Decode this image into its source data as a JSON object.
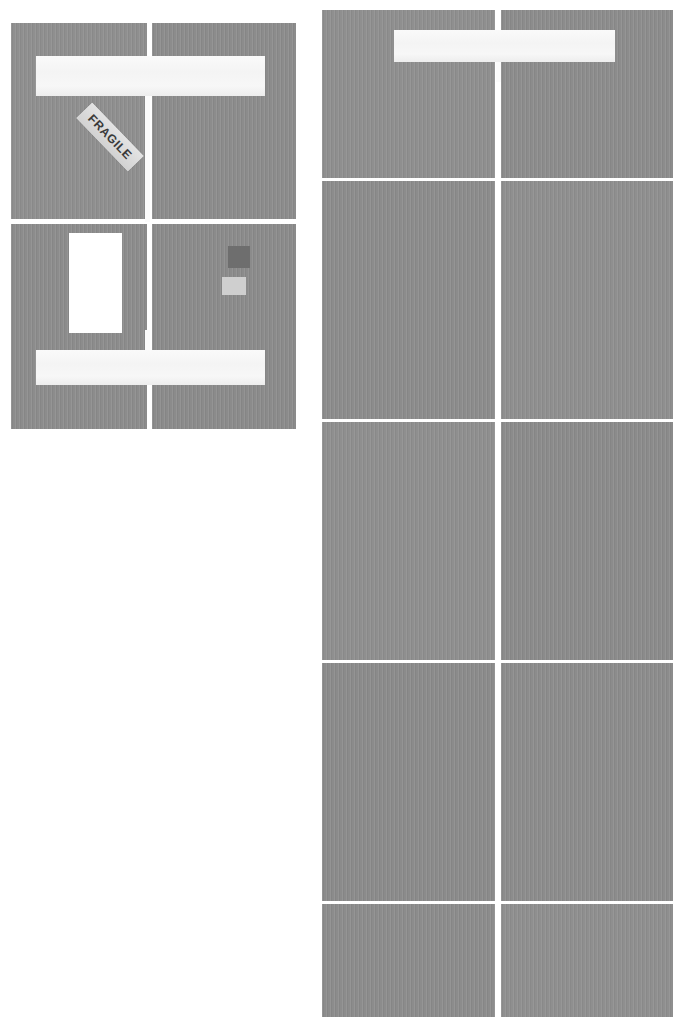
{
  "scene": {
    "title": "Flattened corrugated cardboard panels",
    "background_color": "#ffffff",
    "cardboard_color": "#8f8f8f",
    "tape_color": "#f7f7f7",
    "label_color": "#ffffff"
  },
  "left_carton": {
    "name": "left-carton",
    "bounds": {
      "x": 11,
      "y": 23,
      "width": 285,
      "height": 406
    },
    "top_panel": {
      "tape": {
        "x": 36,
        "y": 56,
        "width": 229,
        "height": 40,
        "color": "#f7f7f7"
      },
      "tape_spine": {
        "x": 145,
        "y": 90,
        "width": 5,
        "height": 130,
        "color": "#fbfbfb"
      },
      "fragile_sticker": {
        "text": "FRAGILE",
        "rotation_deg": 46,
        "background_color": "#dcdcdc",
        "text_color": "#3a3a3a"
      }
    },
    "bottom_panel": {
      "shipping_label": {
        "x": 69,
        "y": 233,
        "width": 53,
        "height": 100,
        "color": "#ffffff"
      },
      "tape": {
        "x": 36,
        "y": 350,
        "width": 229,
        "height": 35,
        "color": "#f7f7f7"
      },
      "tape_spine": {
        "x": 145,
        "y": 330,
        "width": 5,
        "height": 26,
        "color": "#fbfbfb"
      },
      "swatches": [
        {
          "name": "swatch-dark",
          "x": 228,
          "y": 246,
          "width": 22,
          "height": 22,
          "color": "#6e6e6e"
        },
        {
          "name": "swatch-light",
          "x": 222,
          "y": 277,
          "width": 24,
          "height": 18,
          "color": "#cfcfcf"
        }
      ]
    },
    "seams": {
      "vertical_gap_x": 147,
      "horizontal_gap_y": 222
    }
  },
  "right_carton": {
    "name": "right-carton",
    "bounds": {
      "x": 322,
      "y": 10,
      "width": 351,
      "height": 1007
    },
    "columns": 2,
    "vertical_gap_x": 498,
    "tape": {
      "x": 394,
      "y": 30,
      "width": 221,
      "height": 32,
      "color": "#f7f7f7"
    },
    "tape_spine": {
      "x": 496,
      "y": 58,
      "width": 5,
      "height": 24,
      "color": "#fbfbfb"
    },
    "rows": [
      {
        "name": "row-1",
        "y": 10,
        "height": 168
      },
      {
        "name": "row-2",
        "y": 181,
        "height": 238
      },
      {
        "name": "row-3",
        "y": 422,
        "height": 238
      },
      {
        "name": "row-4",
        "y": 663,
        "height": 238
      },
      {
        "name": "row-5",
        "y": 904,
        "height": 113
      }
    ]
  }
}
